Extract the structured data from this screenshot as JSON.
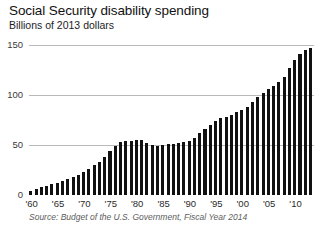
{
  "header": {
    "title": "Social Security disability spending",
    "subtitle": "Billions of 2013 dollars"
  },
  "footer": {
    "source": "Source: Budget of the U.S. Government, Fiscal Year 2014"
  },
  "colors": {
    "bar": "#111111",
    "gridline": "#b9b9b9",
    "background": "#ffffff",
    "text": "#1a1a1a",
    "source_text": "#5d5d5d"
  },
  "chart_data": {
    "type": "bar",
    "title": "Social Security disability spending",
    "subtitle": "Billions of 2013 dollars",
    "xlabel": "",
    "ylabel": "Billions of 2013 dollars",
    "ylim": [
      0,
      155
    ],
    "yticks": [
      0,
      50,
      100,
      150
    ],
    "ytick_labels": [
      "0",
      "50",
      "100",
      "150"
    ],
    "xtick_labels": [
      "'60",
      "'65",
      "'70",
      "'75",
      "'80",
      "'85",
      "'90",
      "'95",
      "'00",
      "'05",
      "'10"
    ],
    "xtick_years": [
      1960,
      1965,
      1970,
      1975,
      1980,
      1985,
      1990,
      1995,
      2000,
      2005,
      2010
    ],
    "grid": true,
    "legend": null,
    "source": "Source: Budget of the U.S. Government, Fiscal Year 2014",
    "x": [
      1960,
      1961,
      1962,
      1963,
      1964,
      1965,
      1966,
      1967,
      1968,
      1969,
      1970,
      1971,
      1972,
      1973,
      1974,
      1975,
      1976,
      1977,
      1978,
      1979,
      1980,
      1981,
      1982,
      1983,
      1984,
      1985,
      1986,
      1987,
      1988,
      1989,
      1990,
      1991,
      1992,
      1993,
      1994,
      1995,
      1996,
      1997,
      1998,
      1999,
      2000,
      2001,
      2002,
      2003,
      2004,
      2005,
      2006,
      2007,
      2008,
      2009,
      2010,
      2011,
      2012,
      2013
    ],
    "values": [
      4,
      6,
      8,
      9,
      11,
      12,
      14,
      16,
      18,
      20,
      23,
      26,
      30,
      33,
      38,
      44,
      49,
      53,
      54,
      54,
      55,
      55,
      52,
      50,
      49,
      50,
      51,
      51,
      52,
      53,
      54,
      57,
      62,
      66,
      70,
      74,
      77,
      78,
      80,
      83,
      85,
      88,
      93,
      98,
      102,
      106,
      109,
      113,
      118,
      127,
      135,
      141,
      145,
      147
    ],
    "units": "billions of 2013 dollars"
  }
}
